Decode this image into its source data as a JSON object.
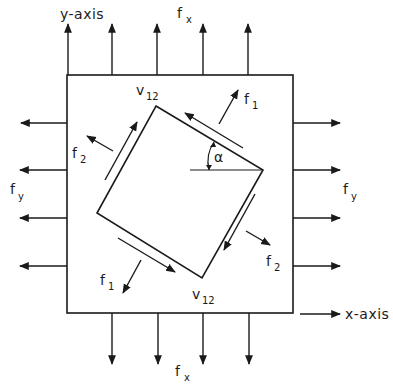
{
  "diagram": {
    "colors": {
      "ink": "#1a1a1a",
      "background": "#ffffff"
    },
    "labels": {
      "y_axis": "y-axis",
      "x_axis": "x-axis",
      "fx_top": {
        "main": "f",
        "sub": "x"
      },
      "fx_bottom": {
        "main": "f",
        "sub": "x"
      },
      "fy_left": {
        "main": "f",
        "sub": "y"
      },
      "fy_right": {
        "main": "f",
        "sub": "y"
      },
      "v12_top": {
        "main": "v",
        "sub": "12"
      },
      "v12_bottom": {
        "main": "v",
        "sub": "12"
      },
      "f1_top": {
        "main": "f",
        "sub": "1"
      },
      "f1_bottom": {
        "main": "f",
        "sub": "1"
      },
      "f2_left": {
        "main": "f",
        "sub": "2"
      },
      "f2_right": {
        "main": "f",
        "sub": "2"
      },
      "angle": "α"
    },
    "outer_box": {
      "x1": 67,
      "y1": 75,
      "x2": 293,
      "y2": 313
    },
    "rotated_square": [
      [
        156,
        106
      ],
      [
        263,
        170
      ],
      [
        202,
        278
      ],
      [
        97,
        213
      ]
    ],
    "arrows": {
      "top_x": [
        67,
        112,
        157,
        203,
        248
      ],
      "bottom_x": [
        112,
        157,
        203,
        248
      ],
      "left_y": [
        123,
        170,
        218,
        266
      ],
      "right_y": [
        123,
        170,
        218,
        266
      ]
    }
  }
}
